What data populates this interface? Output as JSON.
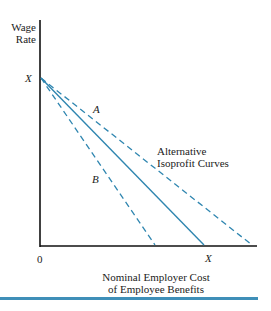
{
  "diagram": {
    "y_axis_label_line1": "Wage",
    "y_axis_label_line2": "Rate",
    "x_axis_label_line1": "Nominal Employer Cost",
    "x_axis_label_line2": "of Employee Benefits",
    "y_intercept_label": "X",
    "x_intercept_label": "X",
    "origin_label": "0",
    "curve_a_label": "A",
    "curve_b_label": "B",
    "annotation_line1": "Alternative",
    "annotation_line2": "Isoprofit Curves",
    "line_color": "#2f86b0",
    "axis_color": "#111111",
    "rule_color": "#3f8fb8",
    "lines": [
      {
        "name": "curve-a",
        "style": "dashed",
        "from": "X (wage axis)",
        "to": "beyond X on cost axis"
      },
      {
        "name": "budget-line",
        "style": "solid",
        "from": "X (wage axis)",
        "to": "X (cost axis)"
      },
      {
        "name": "curve-b",
        "style": "dashed",
        "from": "X (wage axis)",
        "to": "short of X on cost axis"
      }
    ]
  }
}
